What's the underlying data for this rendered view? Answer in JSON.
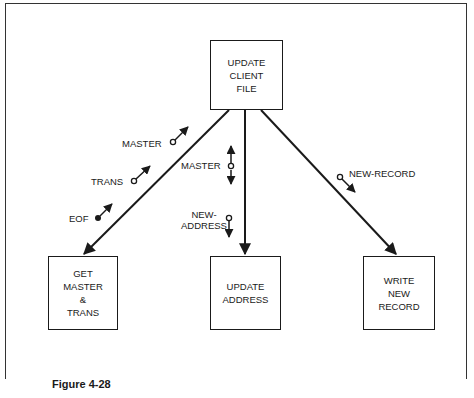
{
  "figure": {
    "caption": "Figure 4-28"
  },
  "modules": {
    "top": {
      "label": "UPDATE\nCLIENT\nFILE"
    },
    "left": {
      "label": "GET\nMASTER\n&\nTRANS"
    },
    "middle": {
      "label": "UPDATE\nADDRESS"
    },
    "right": {
      "label": "WRITE\nNEW\nRECORD"
    }
  },
  "couples": {
    "left_master": {
      "label": "MASTER",
      "type": "data",
      "direction": "up"
    },
    "left_trans": {
      "label": "TRANS",
      "type": "data",
      "direction": "up"
    },
    "left_eof": {
      "label": "EOF",
      "type": "flag",
      "direction": "up"
    },
    "middle_master": {
      "label": "MASTER",
      "type": "data",
      "direction": "both"
    },
    "middle_new_address": {
      "label": "NEW-\nADDRESS",
      "type": "data",
      "direction": "down"
    },
    "right_new_record": {
      "label": "NEW-RECORD",
      "type": "data",
      "direction": "down"
    }
  }
}
